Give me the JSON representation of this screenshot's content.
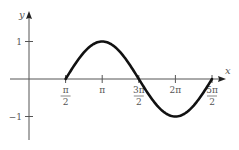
{
  "chart_data": {
    "type": "line",
    "title": "",
    "xlabel": "x",
    "ylabel": "y",
    "function": "y = -cos(x) for x in [π/2, 5π/2]",
    "x_ticks": [
      {
        "value": 1.5708,
        "label_num": "π",
        "label_den": "2",
        "fraction": true
      },
      {
        "value": 3.1416,
        "label": "π",
        "fraction": false
      },
      {
        "value": 4.7124,
        "label_num": "3π",
        "label_den": "2",
        "fraction": true
      },
      {
        "value": 6.2832,
        "label": "2π",
        "fraction": false
      },
      {
        "value": 7.854,
        "label_num": "5π",
        "label_den": "2",
        "fraction": true
      }
    ],
    "y_ticks": [
      {
        "value": 1,
        "label": "1"
      },
      {
        "value": -1,
        "label": "−1"
      }
    ],
    "xlim": [
      0,
      8.6
    ],
    "ylim": [
      -1.5,
      1.6
    ],
    "grid": false,
    "legend": null,
    "series": [
      {
        "name": "curve",
        "x": [
          1.5708,
          2.3562,
          3.1416,
          3.927,
          4.7124,
          5.4978,
          6.2832,
          7.0686,
          7.854
        ],
        "values": [
          0,
          0.7071,
          1,
          0.7071,
          0,
          -0.7071,
          -1,
          -0.7071,
          0
        ]
      }
    ],
    "colors": {
      "curve": "#111111",
      "axes": "#555555",
      "text": "#555555"
    }
  }
}
